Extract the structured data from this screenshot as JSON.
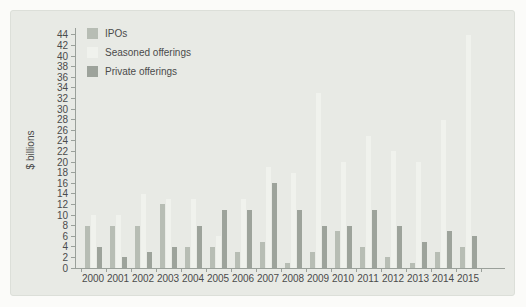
{
  "chart_data": {
    "type": "bar",
    "title": "",
    "xlabel": "",
    "ylabel": "$ billions",
    "ylim": [
      0,
      44
    ],
    "ytick_step": 2,
    "grid": false,
    "legend_position": "top-left",
    "categories": [
      "2000",
      "2001",
      "2002",
      "2003",
      "2004",
      "2005",
      "2006",
      "2007",
      "2008",
      "2009",
      "2010",
      "2011",
      "2012",
      "2013",
      "2014",
      "2015"
    ],
    "series": [
      {
        "name": "IPOs",
        "color": "#b7bdb4",
        "values": [
          8,
          8,
          8,
          12,
          4,
          4,
          3,
          5,
          1,
          3,
          7,
          4,
          2,
          1,
          3,
          4
        ]
      },
      {
        "name": "Seasoned offerings",
        "color": "#f0f2ed",
        "values": [
          10,
          10,
          14,
          13,
          13,
          6,
          13,
          19,
          18,
          33,
          20,
          25,
          22,
          20,
          28,
          44
        ]
      },
      {
        "name": "Private offerings",
        "color": "#9da39b",
        "values": [
          4,
          2,
          3,
          4,
          8,
          11,
          11,
          16,
          11,
          8,
          8,
          11,
          8,
          5,
          7,
          6
        ]
      }
    ]
  },
  "colors": {
    "page_bg": "#fbfbf9",
    "panel_bg": "#e8eae5",
    "axis": "#9aa09a",
    "text": "#4b4b4b"
  }
}
